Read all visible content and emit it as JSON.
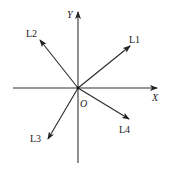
{
  "diagram": {
    "type": "coordinate-vectors",
    "axes": {
      "x_label": "X",
      "y_label": "Y",
      "origin_label": "O"
    },
    "vectors": [
      {
        "name": "L1",
        "quadrant": "I",
        "direction": "up-right"
      },
      {
        "name": "L2",
        "quadrant": "II",
        "direction": "up-left"
      },
      {
        "name": "L3",
        "quadrant": "III",
        "direction": "down-left"
      },
      {
        "name": "L4",
        "quadrant": "IV",
        "direction": "down-right"
      }
    ],
    "colors": {
      "line": "#2a2a2a",
      "background": "#ffffff"
    }
  }
}
